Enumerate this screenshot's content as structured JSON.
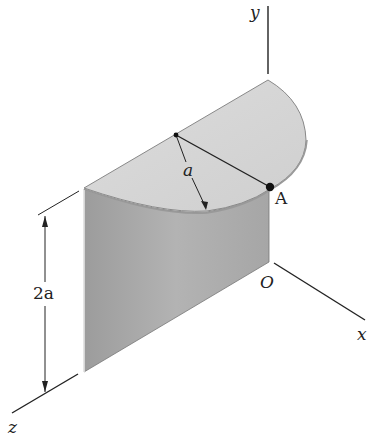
{
  "figure": {
    "type": "3D geometry diagram",
    "colors": {
      "background": "#ffffff",
      "top_face": "#d6d6d6",
      "curved_surface": "#a9a9a9",
      "lines": "#222222"
    },
    "labels": {
      "y_axis": "y",
      "x_axis": "x",
      "z_axis": "z",
      "origin": "O",
      "point_a": "A",
      "radius": "a",
      "height": "2a"
    }
  }
}
